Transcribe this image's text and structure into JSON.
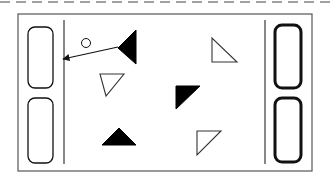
{
  "colors": {
    "background": "#ffffff",
    "stroke": "#111111",
    "frame": "#555555",
    "dash": "#444444",
    "fill_dark": "#000000"
  },
  "scene": {
    "top_divider": {
      "y": 2,
      "dash": "10 6"
    },
    "frame": {
      "x": 18,
      "y": 14,
      "width": 294,
      "height": 157
    },
    "left_goal_line": {
      "x": 64,
      "y1": 20,
      "y2": 164
    },
    "right_goal_line": {
      "x": 265,
      "y1": 20,
      "y2": 164
    },
    "left_paddles": [
      {
        "x": 28,
        "y": 27,
        "width": 25,
        "height": 61,
        "rx": 7,
        "stroke_width": 1.3
      },
      {
        "x": 28,
        "y": 98,
        "width": 25,
        "height": 65,
        "rx": 7,
        "stroke_width": 1.3
      }
    ],
    "right_paddles": [
      {
        "x": 275,
        "y": 25,
        "width": 26,
        "height": 63,
        "rx": 7,
        "stroke_width": 3
      },
      {
        "x": 275,
        "y": 98,
        "width": 26,
        "height": 64,
        "rx": 7,
        "stroke_width": 3
      }
    ],
    "ball": {
      "cx": 86,
      "cy": 43,
      "r": 4.5
    },
    "arrow": {
      "x1": 118,
      "y1": 47,
      "x2": 63,
      "y2": 59
    },
    "triangles": [
      {
        "id": "filled-left-pointing",
        "points": "118,48 136,30 136,64",
        "filled": true
      },
      {
        "id": "outline-down-left",
        "points": "100,74 124,74 106,96",
        "filled": false
      },
      {
        "id": "outline-top-right",
        "points": "212,38 212,62 237,62",
        "filled": false
      },
      {
        "id": "filled-down-left",
        "points": "176,86 200,86 176,109",
        "filled": true
      },
      {
        "id": "filled-up",
        "points": "102,145 119,128 136,145",
        "filled": true
      },
      {
        "id": "outline-bottom-right",
        "points": "197,131 221,131 197,155",
        "filled": false
      }
    ]
  }
}
